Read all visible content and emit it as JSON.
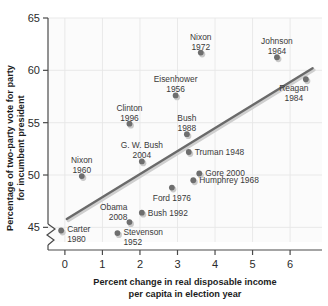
{
  "chart_data": {
    "type": "scatter",
    "title": "",
    "xlabel": "Percent change in real disposable income per capita in election year",
    "xlabel_line1": "Percent change in real disposable income",
    "xlabel_line2": "per capita in election year",
    "ylabel": "Percentage of two-party vote for party for incumbent president",
    "ylabel_line1": "Percentage of two-party vote for party",
    "ylabel_line2": "for incumbent president",
    "xlim": [
      -0.45,
      6.85
    ],
    "ylim": [
      43.6,
      65.0
    ],
    "xticks": [
      0,
      1,
      2,
      3,
      4,
      5,
      6
    ],
    "xtick_labels": [
      "0",
      "1",
      "2",
      "3",
      "4",
      "5",
      "6"
    ],
    "yticks": [
      45,
      50,
      55,
      60,
      65
    ],
    "ytick_labels": [
      "45",
      "50",
      "55",
      "60",
      "65"
    ],
    "grid": true,
    "legend": "none",
    "y_axis_break": true,
    "colors": {
      "point": "#6e6e6e",
      "trend_line": "#6a6a6a",
      "grid": "#e7e7e7",
      "axis": "#4a4a4a",
      "plot_background": "#fbfbfb",
      "text": "#2b2b2b"
    },
    "trend_line": {
      "x_start": 0.05,
      "y_start": 45.8,
      "x_end": 6.6,
      "y_end": 60.2
    },
    "points": [
      {
        "label": "Carter",
        "year": "1980",
        "x": -0.1,
        "y": 44.7,
        "label_pos": "right-2line"
      },
      {
        "label": "Nixon",
        "year": "1960",
        "x": 0.45,
        "y": 49.9,
        "label_pos": "above-2line"
      },
      {
        "label": "Stevenson",
        "year": "1952",
        "x": 1.4,
        "y": 44.45,
        "label_pos": "right-2line"
      },
      {
        "label": "Obama",
        "year": "2008",
        "x": 1.72,
        "y": 45.5,
        "label_pos": "above-left-2line"
      },
      {
        "label": "Clinton",
        "year": "1996",
        "x": 1.72,
        "y": 54.9,
        "label_pos": "above-2line"
      },
      {
        "label": "Bush",
        "year": "1992",
        "x": 2.05,
        "y": 46.4,
        "label_pos": "right-1line"
      },
      {
        "label": "G. W. Bush",
        "year": "2004",
        "x": 2.05,
        "y": 51.3,
        "label_pos": "above-2line"
      },
      {
        "label": "Ford",
        "year": "1976",
        "x": 2.85,
        "y": 48.8,
        "label_pos": "below-1line"
      },
      {
        "label": "Eisenhower",
        "year": "1956",
        "x": 2.95,
        "y": 57.6,
        "label_pos": "above-2line"
      },
      {
        "label": "Bush",
        "year": "1988",
        "x": 3.25,
        "y": 53.9,
        "label_pos": "above-2line"
      },
      {
        "label": "Truman",
        "year": "1948",
        "x": 3.3,
        "y": 52.2,
        "label_pos": "right-1line"
      },
      {
        "label": "Humphrey",
        "year": "1968",
        "x": 3.42,
        "y": 49.5,
        "label_pos": "right-1line"
      },
      {
        "label": "Gore",
        "year": "2000",
        "x": 3.58,
        "y": 50.15,
        "label_pos": "right-1line"
      },
      {
        "label": "Nixon",
        "year": "1972",
        "x": 3.62,
        "y": 61.7,
        "label_pos": "above-2line"
      },
      {
        "label": "Johnson",
        "year": "1964",
        "x": 5.65,
        "y": 61.25,
        "label_pos": "above-2line"
      },
      {
        "label": "Reagan",
        "year": "1984",
        "x": 6.42,
        "y": 59.15,
        "label_pos": "below-right-2line"
      }
    ]
  }
}
